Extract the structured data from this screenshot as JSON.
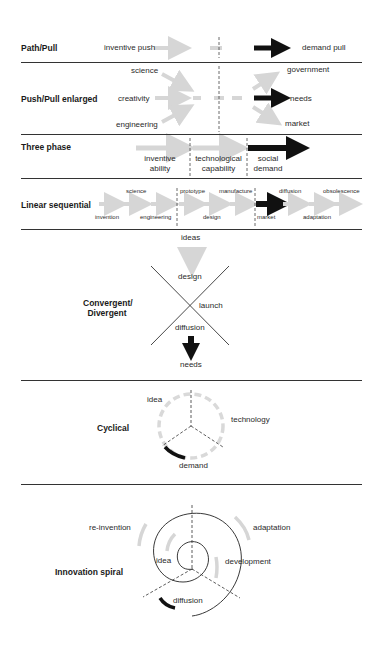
{
  "colors": {
    "light_arrow": "#d6d6d6",
    "dark_arrow": "#111111",
    "line": "#333333"
  },
  "path_pull": {
    "title": "Path/Pull",
    "push": "inventive push",
    "pull": "demand pull"
  },
  "push_pull_enlarged": {
    "title": "Push/Pull enlarged",
    "left": [
      "science",
      "creativity",
      "engineering"
    ],
    "right": [
      "government",
      "needs",
      "market"
    ]
  },
  "three_phase": {
    "title": "Three phase",
    "phases": [
      {
        "line1": "inventive",
        "line2": "ability"
      },
      {
        "line1": "technological",
        "line2": "capability"
      },
      {
        "line1": "social",
        "line2": "demand"
      }
    ]
  },
  "linear_sequential": {
    "title": "Linear sequential",
    "top": [
      "science",
      "prototype",
      "manufacture",
      "diffusion",
      "obsolescence"
    ],
    "bottom": [
      "invention",
      "engineering",
      "design",
      "market",
      "adaptation"
    ]
  },
  "convergent_divergent": {
    "title_line1": "Convergent/",
    "title_line2": "Divergent",
    "top": "ideas",
    "upper": "design",
    "middle": "launch",
    "lower": "diffusion",
    "bottom": "needs"
  },
  "cyclical": {
    "title": "Cyclical",
    "labels": [
      "idea",
      "technology",
      "demand"
    ]
  },
  "innovation_spiral": {
    "title": "Innovation spiral",
    "labels": [
      "re-invention",
      "adaptation",
      "idea",
      "development",
      "diffusion"
    ]
  }
}
